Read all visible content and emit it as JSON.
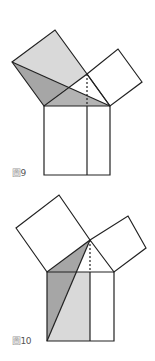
{
  "figures": [
    {
      "label_prefix": "圖",
      "label_number": "9",
      "colors": {
        "light": "#d9d9d9",
        "dark": "#a6a6a6",
        "medium": "#b3b3b3",
        "stroke": "#222222"
      }
    },
    {
      "label_prefix": "圖",
      "label_number": "10",
      "colors": {
        "light": "#d9d9d9",
        "dark": "#a6a6a6",
        "stroke": "#222222"
      }
    }
  ]
}
